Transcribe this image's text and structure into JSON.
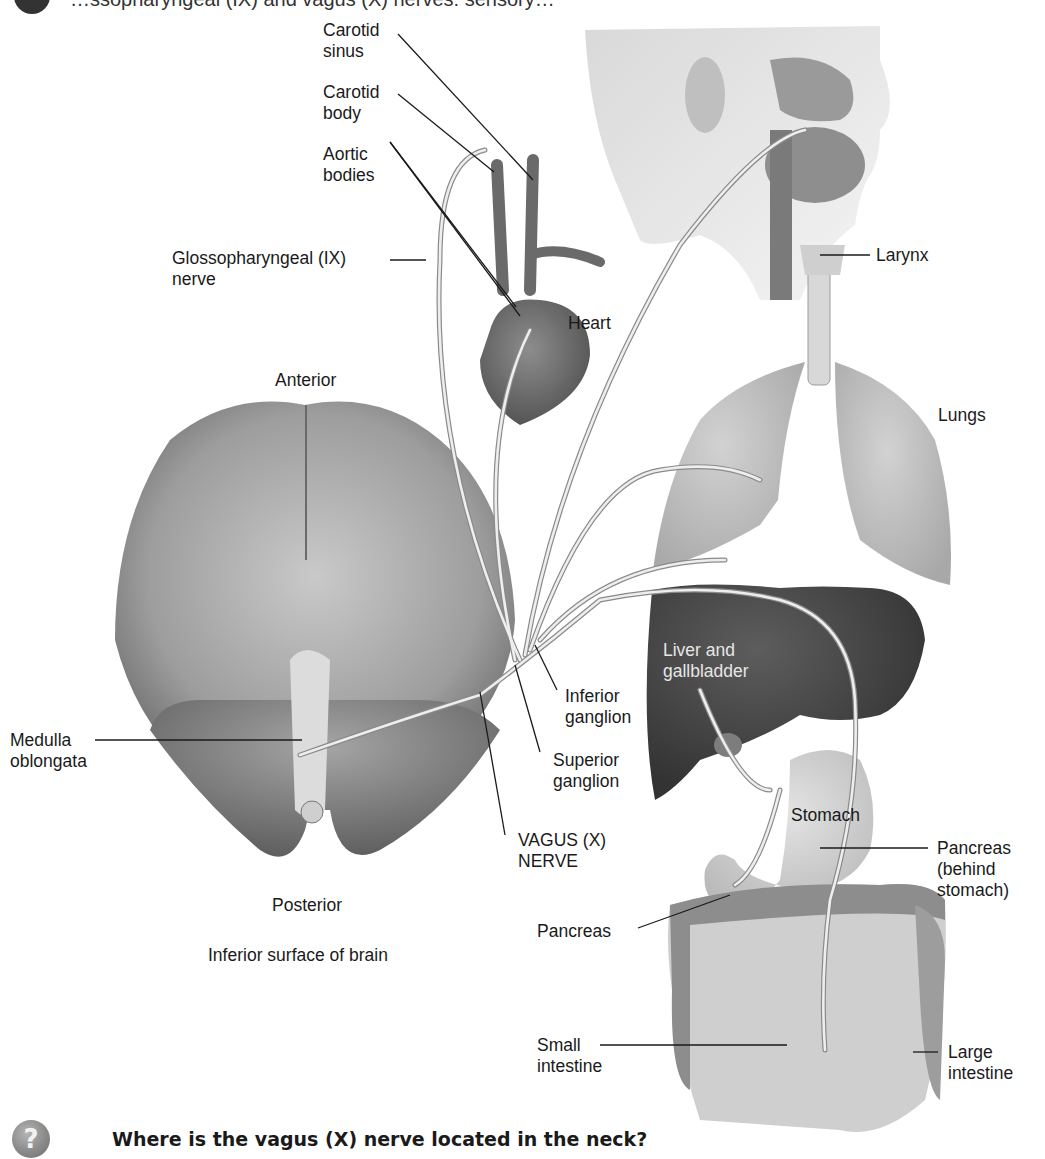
{
  "figure": {
    "top_caption_partial": "…ssopharyngeal (IX) and vagus (X) nerves: sensory…",
    "question": "Where is the vagus (X) nerve located in the neck?",
    "question_icon": "?",
    "colors": {
      "background": "#ffffff",
      "label_text": "#1a1a1a",
      "leader_line": "#1a1a1a",
      "nerve": "#e8e8e8",
      "nerve_outline": "#8a8a8a",
      "brain": "#9a9a9a",
      "liver": "#4a4a4a",
      "lungs": "#bdbdbd",
      "intestine": "#cfcfcf",
      "colon": "#8c8c8c"
    }
  },
  "labels": {
    "carotid_sinus": [
      "Carotid",
      "sinus"
    ],
    "carotid_body": [
      "Carotid",
      "body"
    ],
    "aortic_bodies": [
      "Aortic",
      "bodies"
    ],
    "glossopharyngeal": [
      "Glossopharyngeal (IX)",
      "nerve"
    ],
    "heart": "Heart",
    "larynx": "Larynx",
    "lungs": "Lungs",
    "anterior": "Anterior",
    "posterior": "Posterior",
    "brain_caption": "Inferior surface of brain",
    "medulla": [
      "Medulla",
      "oblongata"
    ],
    "inferior_ganglion": [
      "Inferior",
      "ganglion"
    ],
    "superior_ganglion": [
      "Superior",
      "ganglion"
    ],
    "vagus": [
      "VAGUS (X)",
      "NERVE"
    ],
    "liver": [
      "Liver and",
      "gallbladder"
    ],
    "stomach": "Stomach",
    "pancreas_behind": [
      "Pancreas",
      "(behind",
      "stomach)"
    ],
    "pancreas": "Pancreas",
    "small_intestine": [
      "Small",
      "intestine"
    ],
    "large_intestine": [
      "Large",
      "intestine"
    ]
  }
}
